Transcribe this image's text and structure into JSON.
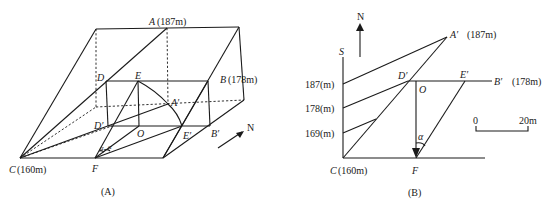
{
  "figure_a": {
    "caption": "(A)",
    "labels": {
      "A": "A",
      "A_elev": "(187m)",
      "B": "B",
      "B_elev": "(178m)",
      "C": "C",
      "C_elev": "(160m)",
      "D": "D",
      "E": "E",
      "A_prime": "A′",
      "D_prime": "D′",
      "O": "O",
      "E_prime": "E′",
      "B_prime": "B′",
      "F": "F",
      "alpha1": "α",
      "alpha2": "α",
      "north": "N"
    }
  },
  "figure_b": {
    "caption": "(B)",
    "labels": {
      "north": "N",
      "S": "S",
      "A_prime": "A′",
      "A_prime_elev": "(187m)",
      "D_prime": "D′",
      "E_prime": "E′",
      "B_prime": "B′",
      "B_prime_elev": "(178m)",
      "O": "O",
      "alpha": "α",
      "C": "C",
      "C_elev": "(160m)",
      "F": "F"
    },
    "axis_ticks": [
      "187(m)",
      "178(m)",
      "169(m)"
    ],
    "scale_bar": {
      "start": "0",
      "end": "20m"
    }
  }
}
